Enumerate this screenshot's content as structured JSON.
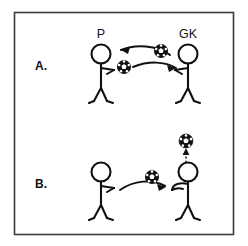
{
  "figure": {
    "background_color": "#ffffff",
    "ink_color": "#111111",
    "frame_color": "#3b3b3b",
    "title": ""
  },
  "panels": [
    {
      "id": "panel-a",
      "letter": "A.",
      "actors": [
        {
          "id": "player",
          "label": "P",
          "role": "field-player",
          "facing": "right"
        },
        {
          "id": "goalkeeper",
          "label": "GK",
          "role": "goalkeeper",
          "facing": "left"
        }
      ],
      "balls": [
        {
          "id": "ball-a-incoming",
          "icon": "soccer-ball-icon"
        },
        {
          "id": "ball-a-outgoing",
          "icon": "soccer-ball-icon"
        }
      ],
      "arrows": [
        {
          "id": "arrow-gk-to-p",
          "style": "solid",
          "direction": "right-to-left"
        },
        {
          "id": "arrow-p-to-gk",
          "style": "solid",
          "direction": "left-to-right"
        }
      ]
    },
    {
      "id": "panel-b",
      "letter": "B.",
      "actors": [
        {
          "id": "passer",
          "label": "",
          "role": "field-player",
          "facing": "right"
        },
        {
          "id": "receiver",
          "label": "",
          "role": "goalkeeper",
          "facing": "left"
        }
      ],
      "balls": [
        {
          "id": "ball-b-pass",
          "icon": "soccer-ball-icon"
        },
        {
          "id": "ball-b-overhead",
          "icon": "soccer-ball-icon"
        }
      ],
      "arrows": [
        {
          "id": "arrow-pass-to-receiver",
          "style": "solid",
          "direction": "left-to-right"
        },
        {
          "id": "arrow-ball-upward",
          "style": "dashed",
          "direction": "upward"
        }
      ]
    }
  ]
}
